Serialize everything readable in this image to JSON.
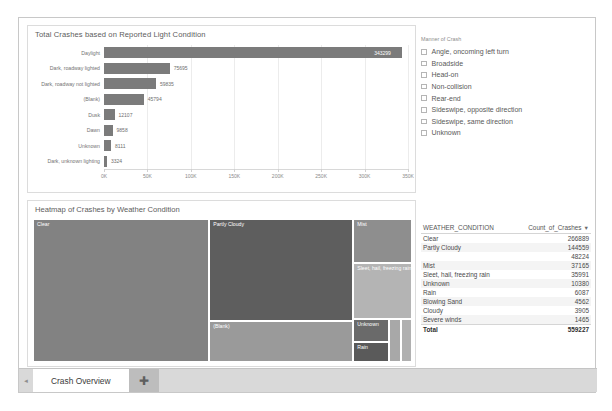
{
  "barchart_card": {
    "title": "Total Crashes based on Reported Light Condition"
  },
  "slicer": {
    "title": "Manner of Crash",
    "items": [
      {
        "label": "Angle, oncoming left turn",
        "checked": false
      },
      {
        "label": "Broadside",
        "checked": false
      },
      {
        "label": "Head-on",
        "checked": false
      },
      {
        "label": "Non-collision",
        "checked": false
      },
      {
        "label": "Rear-end",
        "checked": false
      },
      {
        "label": "Sideswipe, opposite direction",
        "checked": false
      },
      {
        "label": "Sideswipe, same direction",
        "checked": false
      },
      {
        "label": "Unknown",
        "checked": false
      }
    ]
  },
  "heatmap_card": {
    "title": "Heatmap of Crashes by Weather Condition"
  },
  "table": {
    "columns": [
      "WEATHER_CONDITION",
      "Count_of_Crashes"
    ],
    "sort_indicator": "▼",
    "rows": [
      {
        "condition": "Clear",
        "count": "266889"
      },
      {
        "condition": "Partly Cloudy",
        "count": "144559"
      },
      {
        "condition": "",
        "count": "48224"
      },
      {
        "condition": "Mist",
        "count": "37165"
      },
      {
        "condition": "Sleet, hail, freezing rain",
        "count": "35991"
      },
      {
        "condition": "Unknown",
        "count": "10380"
      },
      {
        "condition": "Rain",
        "count": "6087"
      },
      {
        "condition": "Blowing Sand",
        "count": "4562"
      },
      {
        "condition": "Cloudy",
        "count": "3905"
      },
      {
        "condition": "Severe winds",
        "count": "1465"
      }
    ],
    "total_label": "Total",
    "total_value": "559227"
  },
  "tabbar": {
    "scroll_left_icon": "◄",
    "active_tab": "Crash Overview",
    "add_tab_icon": "✚"
  },
  "colors": {
    "bar": "#7b7b7b",
    "card_border": "#dcdcdc",
    "canvas_border": "#c8c8c8",
    "tab_bar": "#d9d9d9"
  },
  "chart_data": [
    {
      "type": "bar",
      "orientation": "horizontal",
      "title": "Total Crashes based on Reported Light Condition",
      "xlabel": "",
      "ylabel": "",
      "categories": [
        "Daylight",
        "Dark, roadway lighted",
        "Dark, roadway not lighted",
        "(Blank)",
        "Dusk",
        "Dawn",
        "Unknown",
        "Dark, unknown lighting"
      ],
      "values": [
        343299,
        75695,
        59835,
        45794,
        12107,
        9858,
        8111,
        3324
      ],
      "value_labels": [
        "343299",
        "75695",
        "59835",
        "45794",
        "12107",
        "9858",
        "8111",
        "3324"
      ],
      "xlim": [
        0,
        350000
      ],
      "tick_labels": [
        "0K",
        "50K",
        "100K",
        "150K",
        "200K",
        "250K",
        "300K",
        "350K"
      ],
      "tick_values": [
        0,
        50000,
        100000,
        150000,
        200000,
        250000,
        300000,
        350000
      ],
      "grid": true,
      "legend": false
    },
    {
      "type": "treemap",
      "title": "Heatmap of Crashes by Weather Condition",
      "legend": false,
      "tiles": [
        {
          "label": "Clear",
          "value": 266889,
          "color": "#828282",
          "x": 0,
          "y": 0,
          "w": 46.5,
          "h": 100
        },
        {
          "label": "Partly Cloudy",
          "value": 144559,
          "color": "#5e5e5e",
          "x": 46.5,
          "y": 0,
          "w": 38.0,
          "h": 71.5
        },
        {
          "label": "(Blank)",
          "value": 48224,
          "color": "#9a9a9a",
          "x": 46.5,
          "y": 71.5,
          "w": 38.0,
          "h": 28.5
        },
        {
          "label": "Mist",
          "value": 37165,
          "color": "#8e8e8e",
          "x": 84.5,
          "y": 0,
          "w": 15.5,
          "h": 31.0
        },
        {
          "label": "Sleet, hail, freezing rain",
          "value": 35991,
          "color": "#b4b4b4",
          "x": 84.5,
          "y": 31.0,
          "w": 15.5,
          "h": 39.0
        },
        {
          "label": "Unknown",
          "value": 10380,
          "color": "#6a6a6a",
          "x": 84.5,
          "y": 70.0,
          "w": 9.5,
          "h": 16.0
        },
        {
          "label": "Rain",
          "value": 6087,
          "color": "#5a5a5a",
          "x": 84.5,
          "y": 86.0,
          "w": 9.5,
          "h": 14.0
        },
        {
          "label": "",
          "value": 4562,
          "color": "#a8a8a8",
          "x": 94.0,
          "y": 70.0,
          "w": 3.2,
          "h": 30.0
        },
        {
          "label": "",
          "value": 3905,
          "color": "#b0b0b0",
          "x": 97.2,
          "y": 70.0,
          "w": 2.8,
          "h": 30.0
        }
      ]
    },
    {
      "type": "table",
      "title": "",
      "columns": [
        "WEATHER_CONDITION",
        "Count_of_Crashes"
      ],
      "rows": [
        [
          "Clear",
          266889
        ],
        [
          "Partly Cloudy",
          144559
        ],
        [
          "",
          48224
        ],
        [
          "Mist",
          37165
        ],
        [
          "Sleet, hail, freezing rain",
          35991
        ],
        [
          "Unknown",
          10380
        ],
        [
          "Rain",
          6087
        ],
        [
          "Blowing Sand",
          4562
        ],
        [
          "Cloudy",
          3905
        ],
        [
          "Severe winds",
          1465
        ]
      ],
      "total": [
        "Total",
        559227
      ]
    }
  ]
}
